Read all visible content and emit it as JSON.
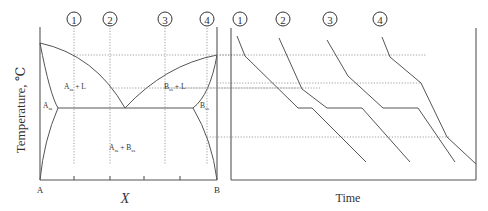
{
  "phase_diagram": {
    "y_axis_label": "Temperature, ℃",
    "x_axis_label": "X",
    "x_left_label": "A",
    "x_right_label": "B",
    "regions": {
      "alpha_liquid": {
        "main": "A",
        "sub": "ss",
        "suffix": " + L"
      },
      "beta_liquid": {
        "main": "B",
        "sub": "ss",
        "suffix": " + L"
      },
      "alpha": {
        "main": "A",
        "sub": "ss"
      },
      "beta": {
        "main": "B",
        "sub": "ss"
      },
      "two_solid": {
        "a": "A",
        "a_sub": "ss",
        "plus": " + ",
        "b": "B",
        "b_sub": "ss"
      }
    },
    "composition_markers": [
      "1",
      "2",
      "3",
      "4"
    ]
  },
  "cooling_curves": {
    "x_axis_label": "Time",
    "curve_markers": [
      "1",
      "2",
      "3",
      "4"
    ]
  }
}
